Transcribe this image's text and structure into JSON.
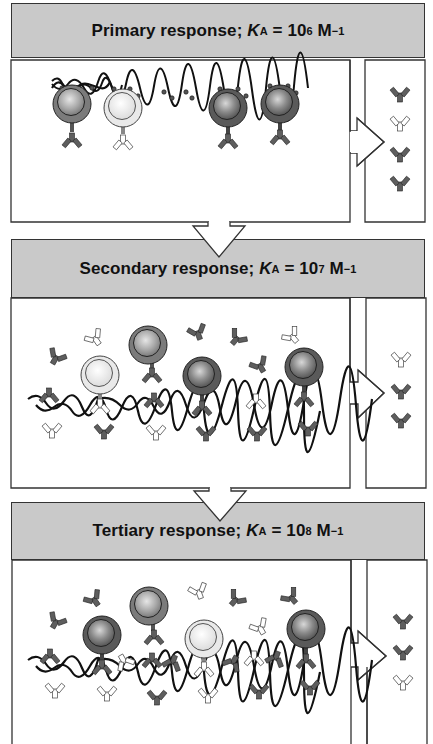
{
  "figure": {
    "panels": [
      {
        "id": "primary",
        "label": "Primary response",
        "constant_symbol": "K",
        "constant_subscript": "A",
        "equals": "=",
        "base": "10",
        "exponent": "6",
        "unit": "M",
        "unit_exponent": "−1",
        "bcells": [
          {
            "shade": "medium",
            "bound": true
          },
          {
            "shade": "light",
            "bound": true
          },
          {
            "shade": "dark",
            "bound": true
          },
          {
            "shade": "dark",
            "bound": true
          }
        ],
        "secreted_antibodies": [
          "medium",
          "light",
          "dark",
          "dark"
        ]
      },
      {
        "id": "secondary",
        "label": "Secondary response",
        "constant_symbol": "K",
        "constant_subscript": "A",
        "equals": "=",
        "base": "10",
        "exponent": "7",
        "unit": "M",
        "unit_exponent": "−1",
        "bcells": [
          {
            "shade": "light",
            "bound": true
          },
          {
            "shade": "medium",
            "bound": false
          },
          {
            "shade": "dark",
            "bound": true
          },
          {
            "shade": "dark",
            "bound": true
          }
        ],
        "secreted_antibodies": [
          "light",
          "dark",
          "dark"
        ]
      },
      {
        "id": "tertiary",
        "label": "Tertiary response",
        "constant_symbol": "K",
        "constant_subscript": "A",
        "equals": "=",
        "base": "10",
        "exponent": "8",
        "unit": "M",
        "unit_exponent": "−1",
        "bcells": [
          {
            "shade": "dark",
            "bound": true
          },
          {
            "shade": "medium",
            "bound": false
          },
          {
            "shade": "light",
            "bound": true
          },
          {
            "shade": "dark",
            "bound": true
          }
        ],
        "secreted_antibodies": [
          "dark",
          "dark",
          "light"
        ]
      }
    ],
    "colors": {
      "header_fill": "#c9c9c9",
      "outline": "#333333",
      "cell_dark": "#5a5a5a",
      "cell_medium": "#7a7a7a",
      "cell_light": "#e6e6e6",
      "antibody_dark": "#5e5e5e",
      "antibody_light": "#ffffff"
    }
  }
}
